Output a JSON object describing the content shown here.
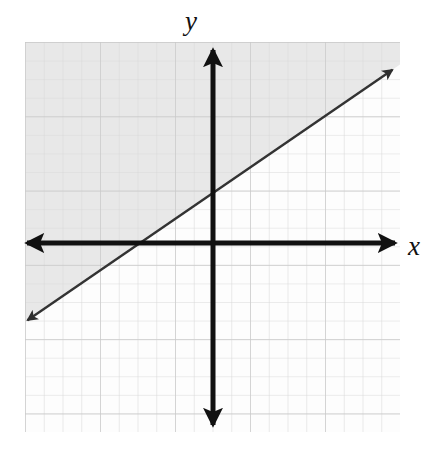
{
  "figure": {
    "background_color": "#ffffff",
    "width": 439,
    "height": 457
  },
  "labels": {
    "y_axis": "y",
    "x_axis": "x"
  },
  "chart_data": {
    "type": "line",
    "title": "",
    "xlabel": "x",
    "ylabel": "y",
    "grid": true,
    "legend": null,
    "xlim": [
      -10.0,
      10.0
    ],
    "ylim": [
      -10.1,
      10.7
    ],
    "origin_px": [
      213,
      243
    ],
    "grid_spacing_px": 18.7,
    "grid_bounds_px": {
      "left": 25,
      "top": 42,
      "right": 400,
      "bottom": 432
    },
    "series": [
      {
        "name": "boundary-line",
        "kind": "line",
        "style": "solid",
        "color": "#333333",
        "slope": 0.6667,
        "intercept": 2.5,
        "x_intercept": -3.5,
        "y_intercept": 2.5,
        "arrow_both_ends": true,
        "endpoints_px": [
          [
            25,
            322
          ],
          [
            395,
            68
          ]
        ],
        "points": [
          [
            -10.0,
            -4.17
          ],
          [
            10.0,
            9.17
          ]
        ]
      }
    ],
    "shaded_region": {
      "name": "above-left-of-line",
      "description": "region above the line is shaded light gray",
      "fill_color": "#e8e8e8",
      "relation": "y >= 0.6667x + 2.5"
    },
    "axes": {
      "x_axis_px": {
        "y": 243,
        "x_start": 24,
        "x_end": 398,
        "arrows": "both"
      },
      "y_axis_px": {
        "x": 213,
        "y_start": 47,
        "y_end": 428,
        "arrows": "both"
      },
      "color": "#111111",
      "thickness_px": 5
    },
    "grid_lines": {
      "minor_color": "#dcdcdc",
      "major_color": "#c8c8c8",
      "major_every": 1
    },
    "tick_labels": []
  }
}
